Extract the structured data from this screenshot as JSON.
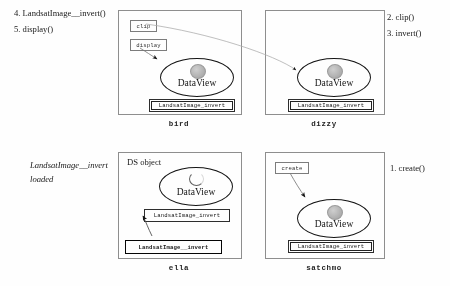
{
  "figure": {
    "background": "#ffffff",
    "ink_color": "#111111",
    "muted_ink": "#8d8d8d"
  },
  "annotations": {
    "top_left": [
      "4. LandsatImage__invert()",
      "5. display()"
    ],
    "top_right": [
      "2. clip()",
      "3. invert()"
    ],
    "bottom_left": [
      "LandsatImage__invert",
      "loaded"
    ],
    "bottom_right": [
      "1. create()"
    ]
  },
  "panels": [
    {
      "id": "bird",
      "label": "bird",
      "ds_label": null,
      "dataview_text": "DataView",
      "blob_style": "filled",
      "class_box": "LandsatImage_invert",
      "message_boxes": [
        "clip",
        "display"
      ]
    },
    {
      "id": "dizzy",
      "label": "dizzy",
      "ds_label": null,
      "dataview_text": "DataView",
      "blob_style": "filled",
      "class_box": "LandsatImage_invert",
      "message_boxes": []
    },
    {
      "id": "ella",
      "label": "ella",
      "ds_label": "DS object",
      "dataview_text": "DataView",
      "blob_style": "empty",
      "class_box": "LandsatImage_invert",
      "loaded_box": "LandsatImage__invert",
      "message_boxes": []
    },
    {
      "id": "satchmo",
      "label": "satchmo",
      "ds_label": null,
      "dataview_text": "DataView",
      "blob_style": "filled",
      "class_box": "LandsatImage_invert",
      "message_boxes": [
        "create"
      ]
    }
  ]
}
